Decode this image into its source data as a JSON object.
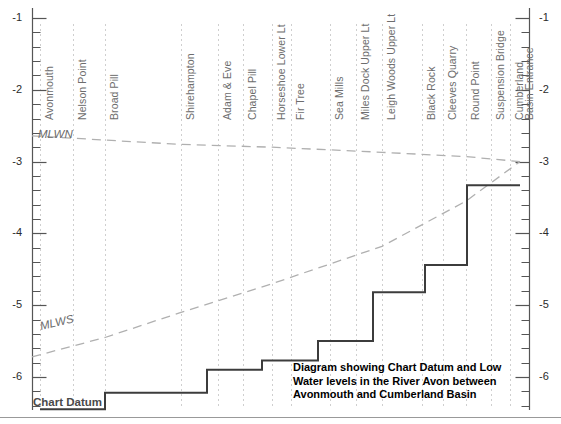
{
  "chart_data": {
    "type": "line",
    "title": "Diagram showing Chart Datum and Low Water levels in the River Avon between Avonmouth and Cumberland Basin",
    "caption_lines": [
      "Diagram showing Chart Datum and Low",
      "Water levels in the River Avon between",
      "Avonmouth and Cumberland Basin"
    ],
    "xlabel": "",
    "ylabel": "",
    "ylim": [
      -6.6,
      -0.7
    ],
    "y_ticks": [
      -1,
      -2,
      -3,
      -4,
      -5,
      -6
    ],
    "y_tick_labels": [
      "-1",
      "-2",
      "-3",
      "-4",
      "-5",
      "-6"
    ],
    "y_minor_step": 0.2,
    "grid": "vertical dotted gridlines at each station",
    "legend": "inline curve labels",
    "stations": [
      {
        "name": "Avonmouth",
        "x": 40
      },
      {
        "name": "Nelson Point",
        "x": 73
      },
      {
        "name": "Broad Pill",
        "x": 105
      },
      {
        "name": "Shirehampton",
        "x": 181
      },
      {
        "name": "Adam & Eve",
        "x": 218
      },
      {
        "name": "Chapel Pill",
        "x": 243
      },
      {
        "name": "Horseshoe Lower Lt",
        "x": 272
      },
      {
        "name": "Fir Tree",
        "x": 291
      },
      {
        "name": "Sea Mills",
        "x": 330
      },
      {
        "name": "Miles Dock Upper Lt",
        "x": 356
      },
      {
        "name": "Leigh Woods Upper Lt",
        "x": 382
      },
      {
        "name": "Black Rock",
        "x": 422
      },
      {
        "name": "Cleeves Quarry",
        "x": 443
      },
      {
        "name": "Round Point",
        "x": 466
      },
      {
        "name": "Suspension Bridge",
        "x": 491
      },
      {
        "name": "Cumberland",
        "x": 510
      },
      {
        "name": "Basin Entrance",
        "x": 520
      }
    ],
    "series": [
      {
        "name": "MLWN",
        "style": "dashed",
        "label": "MLWN",
        "points": [
          {
            "x": 32,
            "y": -2.64
          },
          {
            "x": 105,
            "y": -2.7
          },
          {
            "x": 181,
            "y": -2.76
          },
          {
            "x": 272,
            "y": -2.8
          },
          {
            "x": 382,
            "y": -2.87
          },
          {
            "x": 466,
            "y": -2.93
          },
          {
            "x": 520,
            "y": -3.0
          }
        ]
      },
      {
        "name": "MLWS",
        "style": "dashed",
        "label": "MLWS",
        "points": [
          {
            "x": 32,
            "y": -5.72
          },
          {
            "x": 105,
            "y": -5.45
          },
          {
            "x": 181,
            "y": -5.1
          },
          {
            "x": 272,
            "y": -4.7
          },
          {
            "x": 382,
            "y": -4.18
          },
          {
            "x": 466,
            "y": -3.55
          },
          {
            "x": 520,
            "y": -3.0
          }
        ]
      },
      {
        "name": "Chart Datum",
        "style": "solid-step",
        "label": "Chart Datum",
        "steps": [
          {
            "x_start": 40,
            "x_end": 105,
            "level": -6.45
          },
          {
            "x_start": 105,
            "x_end": 207,
            "level": -6.22
          },
          {
            "x_start": 207,
            "x_end": 262,
            "level": -5.9
          },
          {
            "x_start": 262,
            "x_end": 318,
            "level": -5.77
          },
          {
            "x_start": 318,
            "x_end": 373,
            "level": -5.5
          },
          {
            "x_start": 373,
            "x_end": 425,
            "level": -4.82
          },
          {
            "x_start": 425,
            "x_end": 467,
            "level": -4.44
          },
          {
            "x_start": 467,
            "x_end": 520,
            "level": -3.33
          }
        ]
      }
    ]
  },
  "axis": {
    "left_ticks": [
      "-1",
      "-2",
      "-3",
      "-4",
      "-5",
      "-6"
    ],
    "right_ticks": [
      "-1",
      "-2",
      "-3",
      "-4",
      "-5",
      "-6"
    ]
  },
  "colors": {
    "datum_line": "#3c3c3c",
    "tide_line": "#b0b0b0",
    "grid": "#cfcfcf",
    "axis": "#555555",
    "station_text": "#6d6d6d",
    "caption_text": "#000000"
  }
}
